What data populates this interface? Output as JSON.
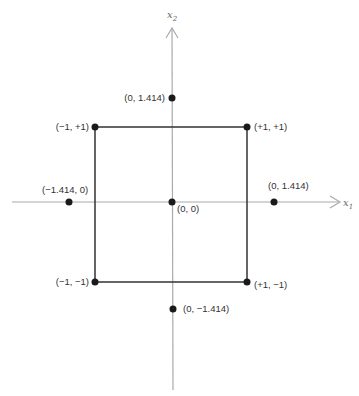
{
  "diagram": {
    "type": "central-composite-design",
    "colors": {
      "axis": "#aaaaaa",
      "square": "#333333",
      "point": "#1a1a1a",
      "label": "#333333"
    },
    "axes": {
      "x1_label": "x",
      "x1_sub": "1",
      "x2_label": "x",
      "x2_sub": "2"
    },
    "points": [
      {
        "id": "corner-tl",
        "label": "(−1, +1)"
      },
      {
        "id": "corner-tr",
        "label": "(+1, +1)"
      },
      {
        "id": "corner-bl",
        "label": "(−1, −1)"
      },
      {
        "id": "corner-br",
        "label": "(+1, −1)"
      },
      {
        "id": "axial-top",
        "label": "(0, 1.414)"
      },
      {
        "id": "axial-bottom",
        "label": "(0, −1.414)"
      },
      {
        "id": "axial-left",
        "label": "(−1.414, 0)"
      },
      {
        "id": "axial-right",
        "label": "(0, 1.414)"
      },
      {
        "id": "center",
        "label": "(0, 0)"
      }
    ]
  }
}
